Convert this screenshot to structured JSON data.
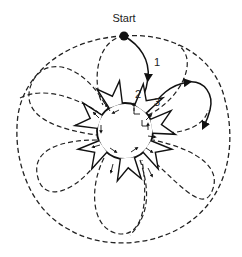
{
  "diagram": {
    "start_label": "Start",
    "path_labels": [
      "1",
      "2",
      "3"
    ],
    "colors": {
      "ink": "#111111",
      "background": "#ffffff"
    },
    "center": {
      "cx": 125,
      "cy": 131,
      "r": 28
    },
    "start_point": {
      "x": 124,
      "y": 36
    },
    "spike_count": 8,
    "petal_count": 6
  }
}
